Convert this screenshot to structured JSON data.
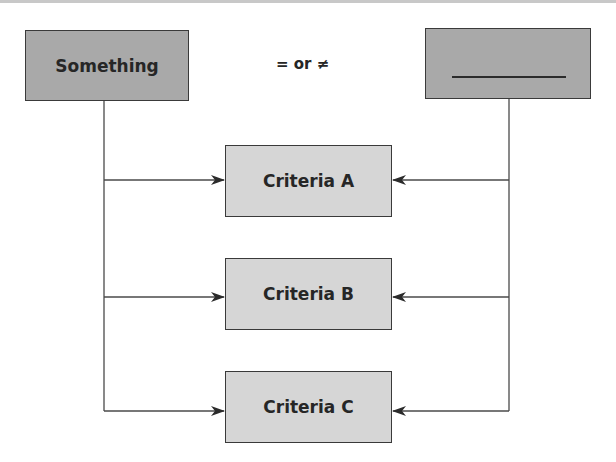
{
  "diagram": {
    "source_box": {
      "label": "Something"
    },
    "relation": {
      "label": "= or ≠"
    },
    "target_box": {
      "label": "",
      "blank": true
    },
    "criteria": [
      {
        "label": "Criteria A"
      },
      {
        "label": "Criteria B"
      },
      {
        "label": "Criteria C"
      }
    ],
    "colors": {
      "top_box_fill": "#a9a9a9",
      "criteria_box_fill": "#d6d6d6",
      "stroke": "#3a3a3a",
      "text": "#262626"
    }
  }
}
